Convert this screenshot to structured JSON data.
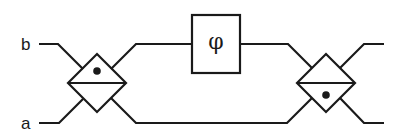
{
  "diagram": {
    "inputs": [
      {
        "label": "b",
        "port": "upper"
      },
      {
        "label": "a",
        "port": "lower"
      }
    ],
    "phase_shifter": {
      "symbol": "φ"
    },
    "beam_splitters": [
      {
        "name": "left",
        "dot": "upper"
      },
      {
        "name": "right",
        "dot": "lower"
      }
    ],
    "colors": {
      "stroke": "#1a1a1a",
      "background": "#ffffff"
    }
  }
}
